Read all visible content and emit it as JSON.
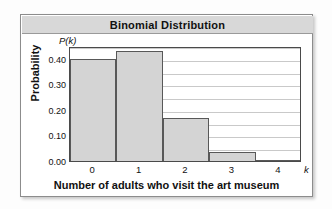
{
  "card": {
    "title": "Binomial Distribution"
  },
  "chart_data": {
    "type": "bar",
    "title": "Binomial Distribution",
    "xlabel": "Number of adults who visit the art museum",
    "ylabel": "Probability",
    "x_axis_symbol": "k",
    "y_axis_symbol": "P(k)",
    "categories": [
      "0",
      "1",
      "2",
      "3",
      "4"
    ],
    "values": [
      0.4,
      0.43,
      0.17,
      0.035,
      0.002
    ],
    "xlim": [
      -0.5,
      4.5
    ],
    "ylim": [
      0.0,
      0.45
    ],
    "ytick_labels": [
      "0.00",
      "0.10",
      "0.20",
      "0.30",
      "0.40"
    ],
    "ytick_values": [
      0.0,
      0.1,
      0.2,
      0.3,
      0.4
    ],
    "gridlines": [
      0.05,
      0.1,
      0.15,
      0.2,
      0.25,
      0.3,
      0.35,
      0.4,
      0.45
    ],
    "grid": true,
    "legend": false,
    "bar_fill": "#d4d4d4",
    "bar_edge": "#585858",
    "title_bar_bg": "#d8d8d8"
  }
}
